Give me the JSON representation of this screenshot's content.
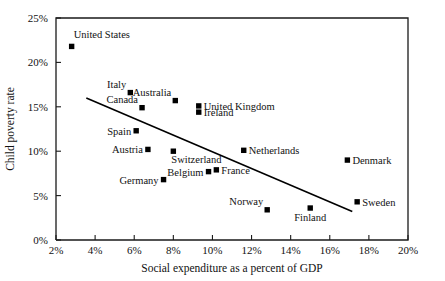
{
  "chart_data": {
    "type": "scatter",
    "title": "",
    "xlabel": "Social expenditure as a percent of GDP",
    "ylabel": "Child poverty rate",
    "xlim": [
      2,
      20
    ],
    "ylim": [
      0,
      25
    ],
    "grid": false,
    "legend": "none",
    "x_tick_labels": [
      "2%",
      "4%",
      "6%",
      "8%",
      "10%",
      "12%",
      "14%",
      "16%",
      "18%",
      "20%"
    ],
    "x_ticks": [
      2,
      4,
      6,
      8,
      10,
      12,
      14,
      16,
      18,
      20
    ],
    "y_tick_labels": [
      "0%",
      "5%",
      "10%",
      "15%",
      "20%",
      "25%"
    ],
    "y_ticks": [
      0,
      5,
      10,
      15,
      20,
      25
    ],
    "points": [
      {
        "label": "United States",
        "x": 2.8,
        "y": 21.8,
        "label_pos": "top-right"
      },
      {
        "label": "Italy",
        "x": 5.8,
        "y": 16.6,
        "label_pos": "top-left"
      },
      {
        "label": "Canada",
        "x": 6.4,
        "y": 14.9,
        "label_pos": "top-left"
      },
      {
        "label": "Australia",
        "x": 8.1,
        "y": 15.7,
        "label_pos": "top-left"
      },
      {
        "label": "United Kingdom",
        "x": 9.3,
        "y": 15.1,
        "label_pos": "right"
      },
      {
        "label": "Ireland",
        "x": 9.3,
        "y": 14.4,
        "label_pos": "right"
      },
      {
        "label": "Spain",
        "x": 6.1,
        "y": 12.3,
        "label_pos": "left"
      },
      {
        "label": "Austria",
        "x": 6.7,
        "y": 10.2,
        "label_pos": "left"
      },
      {
        "label": "Switzerland",
        "x": 8.0,
        "y": 10.0,
        "label_pos": "bottom-right"
      },
      {
        "label": "Netherlands",
        "x": 11.6,
        "y": 10.1,
        "label_pos": "right"
      },
      {
        "label": "Denmark",
        "x": 16.9,
        "y": 9.0,
        "label_pos": "right"
      },
      {
        "label": "Belgium",
        "x": 9.8,
        "y": 7.7,
        "label_pos": "left"
      },
      {
        "label": "France",
        "x": 10.2,
        "y": 7.9,
        "label_pos": "right"
      },
      {
        "label": "Germany",
        "x": 7.5,
        "y": 6.8,
        "label_pos": "left"
      },
      {
        "label": "Sweden",
        "x": 17.4,
        "y": 4.3,
        "label_pos": "right"
      },
      {
        "label": "Norway",
        "x": 12.8,
        "y": 3.4,
        "label_pos": "top-left"
      },
      {
        "label": "Finland",
        "x": 15.0,
        "y": 3.6,
        "label_pos": "bottom"
      }
    ],
    "trend_line": {
      "x1": 3.55,
      "y1": 16.0,
      "x2": 17.15,
      "y2": 3.2
    }
  }
}
